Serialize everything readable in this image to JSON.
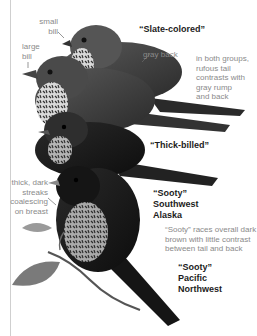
{
  "figure": {
    "groups": [
      {
        "id": "slate-colored",
        "title": "“Slate-colored”"
      },
      {
        "id": "thick-billed",
        "title": "“Thick-billed”"
      },
      {
        "id": "sooty-sw-alaska",
        "title": "“Sooty”\nSouthwest\nAlaska"
      },
      {
        "id": "sooty-pacific-nw",
        "title": "“Sooty”\nPacific\nNorthwest"
      }
    ],
    "annotations": {
      "small_bill": "small\nbill",
      "large_bill": "large\nbill",
      "gray_back": "gray back",
      "rufous_tail": "in both groups,\nrufous tail\ncontrasts with\ngray rump\nand back",
      "thick_streaks": "thick, dark\nstreaks\ncoalescing\non breast",
      "sooty_note": "“Sooty” races overall dark\nbrown with little contrast\nbetween tail and back"
    }
  }
}
